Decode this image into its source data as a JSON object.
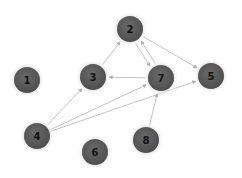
{
  "diagram": {
    "type": "directed-graph",
    "colors": {
      "node_fill": "#5e5e5e",
      "node_glow": "#d4d4d4",
      "edge": "#b4b4b4",
      "label": "#111111"
    },
    "nodes": [
      {
        "id": "1",
        "label": "1",
        "x": 27,
        "y": 80
      },
      {
        "id": "2",
        "label": "2",
        "x": 130,
        "y": 29
      },
      {
        "id": "3",
        "label": "3",
        "x": 93,
        "y": 77
      },
      {
        "id": "4",
        "label": "4",
        "x": 37,
        "y": 136
      },
      {
        "id": "5",
        "label": "5",
        "x": 211,
        "y": 76
      },
      {
        "id": "6",
        "label": "6",
        "x": 95,
        "y": 152
      },
      {
        "id": "7",
        "label": "7",
        "x": 161,
        "y": 78
      },
      {
        "id": "8",
        "label": "8",
        "x": 146,
        "y": 140
      }
    ],
    "edges": [
      {
        "from": "3",
        "to": "2"
      },
      {
        "from": "2",
        "to": "5"
      },
      {
        "from": "2",
        "to": "7"
      },
      {
        "from": "7",
        "to": "2"
      },
      {
        "from": "7",
        "to": "3"
      },
      {
        "from": "4",
        "to": "3"
      },
      {
        "from": "4",
        "to": "7"
      },
      {
        "from": "4",
        "to": "5"
      },
      {
        "from": "8",
        "to": "7"
      }
    ]
  }
}
